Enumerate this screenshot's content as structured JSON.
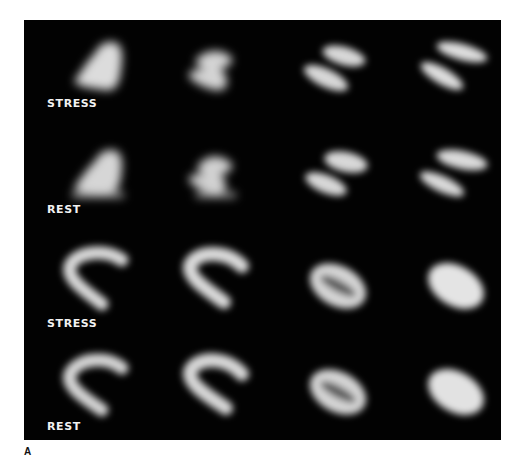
{
  "figure": {
    "panel_label": "A",
    "rows": [
      {
        "label": "STRESS",
        "slice_shapes": [
          "bell",
          "z-shape",
          "split",
          "horseshoe"
        ]
      },
      {
        "label": "REST",
        "slice_shapes": [
          "bell-base",
          "z-shape-base",
          "split-base",
          "horseshoe-base"
        ]
      },
      {
        "label": "STRESS",
        "slice_shapes": [
          "horseshoe",
          "horseshoe",
          "ring",
          "ellipsoid"
        ]
      },
      {
        "label": "REST",
        "slice_shapes": [
          "horseshoe",
          "horseshoe",
          "ring",
          "ellipsoid"
        ]
      }
    ],
    "colors": {
      "background": "#020202",
      "uptake": "#e6e6e6",
      "label": "#f2f2f2"
    }
  }
}
